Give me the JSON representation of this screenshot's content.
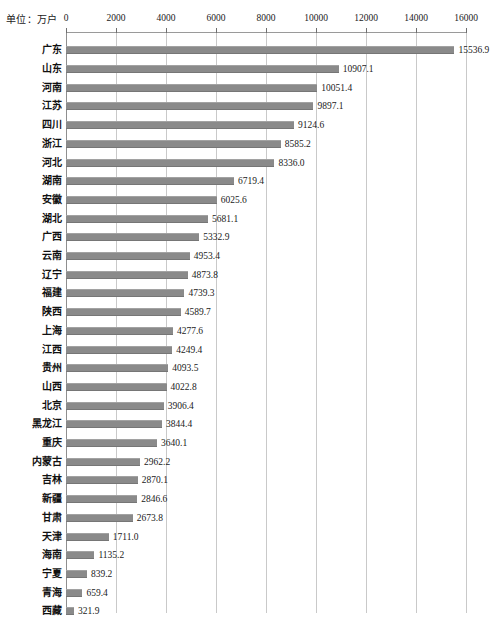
{
  "caption": {
    "unit_text": "单位：万户"
  },
  "chart_data": {
    "type": "bar",
    "orientation": "horizontal",
    "title": "",
    "subtitle": "",
    "xlabel": "",
    "ylabel": "",
    "unit_note": "单位：万户",
    "xlim": [
      0,
      16000
    ],
    "grid": true,
    "legend": null,
    "tick_labels": [
      "0",
      "2000",
      "4000",
      "6000",
      "8000",
      "10000",
      "12000",
      "14000",
      "16000"
    ],
    "ticks": [
      0,
      2000,
      4000,
      6000,
      8000,
      10000,
      12000,
      14000,
      16000
    ],
    "bar_color": "#8a8a8a",
    "grid_color": "#c9c9c9",
    "categories": [
      "广东",
      "山东",
      "河南",
      "江苏",
      "四川",
      "浙江",
      "河北",
      "湖南",
      "安徽",
      "湖北",
      "广西",
      "云南",
      "辽宁",
      "福建",
      "陕西",
      "上海",
      "江西",
      "贵州",
      "山西",
      "北京",
      "黑龙江",
      "重庆",
      "内蒙古",
      "吉林",
      "新疆",
      "甘肃",
      "天津",
      "海南",
      "宁夏",
      "青海",
      "西藏"
    ],
    "values": [
      15536.9,
      10907.1,
      10051.4,
      9897.1,
      9124.6,
      8585.2,
      8336.0,
      6719.4,
      6025.6,
      5681.1,
      5332.9,
      4953.4,
      4873.8,
      4739.3,
      4589.7,
      4277.6,
      4249.4,
      4093.5,
      4022.8,
      3906.4,
      3844.4,
      3640.1,
      2962.2,
      2870.1,
      2846.6,
      2673.8,
      1711.0,
      1135.2,
      839.2,
      659.4,
      321.9
    ],
    "value_labels": [
      "15536.9",
      "10907.1",
      "10051.4",
      "9897.1",
      "9124.6",
      "8585.2",
      "8336.0",
      "6719.4",
      "6025.6",
      "5681.1",
      "5332.9",
      "4953.4",
      "4873.8",
      "4739.3",
      "4589.7",
      "4277.6",
      "4249.4",
      "4093.5",
      "4022.8",
      "3906.4",
      "3844.4",
      "3640.1",
      "2962.2",
      "2870.1",
      "2846.6",
      "2673.8",
      "1711.0",
      "1135.2",
      "839.2",
      "659.4",
      "321.9"
    ]
  }
}
